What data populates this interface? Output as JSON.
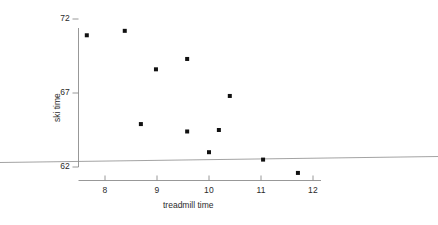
{
  "chart_data": {
    "type": "scatter",
    "title": "",
    "xlabel": "treadmill time",
    "ylabel": "ski time",
    "xlim": [
      7.35,
      12.2
    ],
    "ylim": [
      61.1,
      72.4
    ],
    "xticks": [
      8,
      9,
      10,
      11,
      12
    ],
    "xtick_labels": [
      "8",
      "9",
      "10",
      "11",
      "12"
    ],
    "yticks": [
      62,
      67,
      72
    ],
    "ytick_labels": [
      "62",
      "67",
      "72"
    ],
    "grid": false,
    "legend": "none",
    "marker": "square",
    "marker_color": "#111111",
    "marker_size_px": 4,
    "x": [
      7.65,
      8.38,
      8.69,
      8.98,
      9.58,
      9.58,
      10.0,
      10.19,
      10.4,
      11.04,
      11.71
    ],
    "y": [
      70.9,
      71.2,
      64.9,
      68.6,
      69.3,
      64.4,
      63.0,
      64.5,
      66.8,
      62.5,
      61.6
    ],
    "points": [
      {
        "x": 7.65,
        "y": 70.9
      },
      {
        "x": 8.38,
        "y": 71.2
      },
      {
        "x": 8.69,
        "y": 64.9
      },
      {
        "x": 8.98,
        "y": 68.6
      },
      {
        "x": 9.58,
        "y": 69.3
      },
      {
        "x": 9.58,
        "y": 64.4
      },
      {
        "x": 10.0,
        "y": 63.0
      },
      {
        "x": 10.19,
        "y": 64.5
      },
      {
        "x": 10.4,
        "y": 66.8
      },
      {
        "x": 11.04,
        "y": 62.5
      },
      {
        "x": 11.71,
        "y": 61.6
      }
    ],
    "overlay_line": {
      "name": "horizontal-rule",
      "color": "#8c8c8c",
      "width_px": 0.8,
      "start": {
        "px_x": 0,
        "px_y": 162.5
      },
      "end": {
        "px_x": 438,
        "px_y": 156.5
      }
    },
    "axis_color": "#8c8c8c",
    "background": "#ffffff"
  },
  "axes": {
    "x_title": "treadmill time",
    "y_title": "ski time",
    "x_ticks": [
      {
        "label": "8",
        "px": 105
      },
      {
        "label": "9",
        "px": 157
      },
      {
        "label": "10",
        "px": 209
      },
      {
        "label": "11",
        "px": 261
      },
      {
        "label": "12",
        "px": 313
      }
    ],
    "y_ticks": [
      {
        "label": "72",
        "px": 19
      },
      {
        "label": "67",
        "px": 93
      },
      {
        "label": "62",
        "px": 167
      }
    ]
  }
}
